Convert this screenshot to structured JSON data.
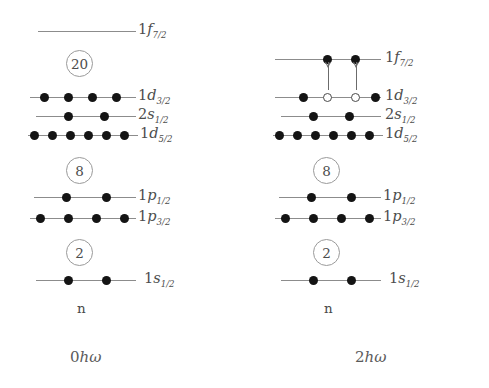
{
  "figure": {
    "type": "nuclear-shell-model-diagram"
  },
  "panels": [
    {
      "id": "left",
      "caption_number": "0",
      "caption_h": "h",
      "caption_omega": "ω",
      "axis_label": "n",
      "levels": [
        {
          "name": "1f7/2",
          "n": "1",
          "l": "f",
          "j": "7/2",
          "occupancy": 0,
          "capacity": 8,
          "markers": []
        },
        {
          "name": "1d3/2",
          "n": "1",
          "l": "d",
          "j": "3/2",
          "occupancy": 4,
          "capacity": 4,
          "markers": [
            "filled",
            "filled",
            "filled",
            "filled"
          ]
        },
        {
          "name": "2s1/2",
          "n": "2",
          "l": "s",
          "j": "1/2",
          "occupancy": 2,
          "capacity": 2,
          "markers": [
            "filled",
            "filled"
          ]
        },
        {
          "name": "1d5/2",
          "n": "1",
          "l": "d",
          "j": "5/2",
          "occupancy": 6,
          "capacity": 6,
          "markers": [
            "filled",
            "filled",
            "filled",
            "filled",
            "filled",
            "filled"
          ]
        },
        {
          "name": "1p1/2",
          "n": "1",
          "l": "p",
          "j": "1/2",
          "occupancy": 2,
          "capacity": 2,
          "markers": [
            "filled",
            "filled"
          ]
        },
        {
          "name": "1p3/2",
          "n": "1",
          "l": "p",
          "j": "3/2",
          "occupancy": 4,
          "capacity": 4,
          "markers": [
            "filled",
            "filled",
            "filled",
            "filled"
          ]
        },
        {
          "name": "1s1/2",
          "n": "1",
          "l": "s",
          "j": "1/2",
          "occupancy": 2,
          "capacity": 2,
          "markers": [
            "filled",
            "filled"
          ]
        }
      ],
      "magic_numbers": [
        "20",
        "8",
        "2"
      ],
      "arrows": []
    },
    {
      "id": "right",
      "caption_number": "2",
      "caption_h": "h",
      "caption_omega": "ω",
      "axis_label": "n",
      "levels": [
        {
          "name": "1f7/2",
          "n": "1",
          "l": "f",
          "j": "7/2",
          "occupancy": 2,
          "capacity": 8,
          "markers": [
            "filled",
            "filled"
          ]
        },
        {
          "name": "1d3/2",
          "n": "1",
          "l": "d",
          "j": "3/2",
          "occupancy": 2,
          "capacity": 4,
          "markers": [
            "filled",
            "hole",
            "hole",
            "filled"
          ]
        },
        {
          "name": "2s1/2",
          "n": "2",
          "l": "s",
          "j": "1/2",
          "occupancy": 2,
          "capacity": 2,
          "markers": [
            "filled",
            "filled"
          ]
        },
        {
          "name": "1d5/2",
          "n": "1",
          "l": "d",
          "j": "5/2",
          "occupancy": 6,
          "capacity": 6,
          "markers": [
            "filled",
            "filled",
            "filled",
            "filled",
            "filled",
            "filled"
          ]
        },
        {
          "name": "1p1/2",
          "n": "1",
          "l": "p",
          "j": "1/2",
          "occupancy": 2,
          "capacity": 2,
          "markers": [
            "filled",
            "filled"
          ]
        },
        {
          "name": "1p3/2",
          "n": "1",
          "l": "p",
          "j": "3/2",
          "occupancy": 4,
          "capacity": 4,
          "markers": [
            "filled",
            "filled",
            "filled",
            "filled"
          ]
        },
        {
          "name": "1s1/2",
          "n": "1",
          "l": "s",
          "j": "1/2",
          "occupancy": 2,
          "capacity": 2,
          "markers": [
            "filled",
            "filled"
          ]
        }
      ],
      "magic_numbers": [
        "8",
        "2"
      ],
      "arrows": [
        {
          "from": "1d3/2",
          "to": "1f7/2",
          "direction": "up"
        },
        {
          "from": "1d3/2",
          "to": "1f7/2",
          "direction": "up"
        }
      ]
    }
  ],
  "labels": {
    "f72": {
      "n": "1",
      "orb": "f",
      "sub": "7/2"
    },
    "d32": {
      "n": "1",
      "orb": "d",
      "sub": "3/2"
    },
    "s12_2": {
      "n": "2",
      "orb": "s",
      "sub": "1/2"
    },
    "d52": {
      "n": "1",
      "orb": "d",
      "sub": "5/2"
    },
    "p12": {
      "n": "1",
      "orb": "p",
      "sub": "1/2"
    },
    "p32": {
      "n": "1",
      "orb": "p",
      "sub": "3/2"
    },
    "s12_1": {
      "n": "1",
      "orb": "s",
      "sub": "1/2"
    }
  },
  "colors": {
    "line": "#8c8c8c",
    "particle": "#141414",
    "hole_stroke": "#4a4a4a",
    "text": "#4a4a4a",
    "circle_stroke": "#9a9a9a",
    "background": "#ffffff"
  }
}
